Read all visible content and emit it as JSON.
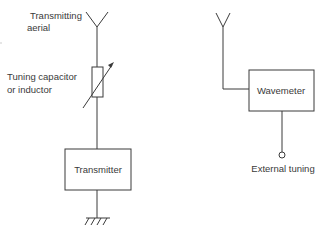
{
  "diagram": {
    "type": "block-diagram",
    "left_circuit": {
      "aerial_label_line1": "Transmitting",
      "aerial_label_line2": "aerial",
      "tuning_label_line1": "Tuning capacitor",
      "tuning_label_line2": "or inductor",
      "transmitter_label": "Transmitter",
      "ground_symbol": "earth-ground"
    },
    "right_circuit": {
      "wavemeter_label": "Wavemeter",
      "external_tuning_label": "External tuning",
      "aerial_symbol": "antenna"
    },
    "colors": {
      "ink": "#3a3a3a",
      "background": "#ffffff"
    }
  }
}
